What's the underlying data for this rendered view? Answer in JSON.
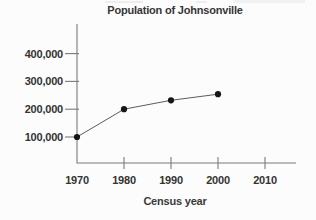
{
  "figure": {
    "background": "#fcfcfc"
  },
  "chart_data": {
    "type": "line",
    "title": "Population of Johnsonville",
    "xlabel": "Census year",
    "ylabel": "",
    "x": [
      1970,
      1980,
      1990,
      2000
    ],
    "values": [
      100000,
      200000,
      232000,
      254000
    ],
    "x_ticks": [
      {
        "value": 1970,
        "label": "1970",
        "mark": false
      },
      {
        "value": 1980,
        "label": "1980",
        "mark": true
      },
      {
        "value": 1990,
        "label": "1990",
        "mark": true
      },
      {
        "value": 2000,
        "label": "2000",
        "mark": true
      },
      {
        "value": 2010,
        "label": "2010",
        "mark": true
      }
    ],
    "y_ticks": [
      {
        "value": 100000,
        "label": "100,000"
      },
      {
        "value": 200000,
        "label": "200,000"
      },
      {
        "value": 300000,
        "label": "300,000"
      },
      {
        "value": 400000,
        "label": "400,000"
      }
    ],
    "xlim": [
      1970,
      2016
    ],
    "ylim": [
      0,
      450000
    ],
    "grid": false,
    "legend": null,
    "marker": "point",
    "colors": {
      "line": "#5c5c5c",
      "point": "#161616",
      "axis": "#7a7a7a",
      "text": "#333333"
    }
  }
}
